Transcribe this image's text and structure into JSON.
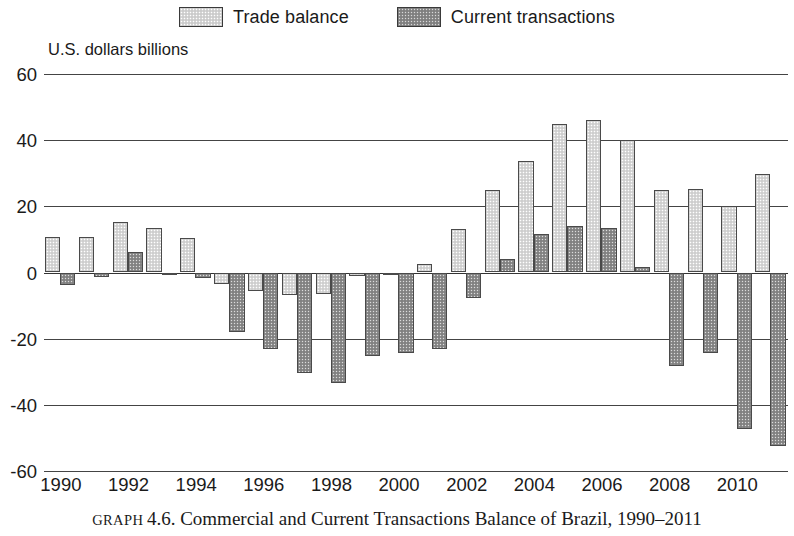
{
  "legend": {
    "items": [
      {
        "label": "Trade balance",
        "key": "trade",
        "swatch": "light-gray-dotted",
        "color": "#d9d9d9"
      },
      {
        "label": "Current transactions",
        "key": "current",
        "swatch": "dark-gray-dotted",
        "color": "#8c8c8c"
      }
    ]
  },
  "axis_title": "U.S. dollars billions",
  "caption": {
    "label": "GRAPH",
    "number": "4.6.",
    "text": "Commercial and Current Transactions Balance of Brazil, 1990–2011"
  },
  "chart_data": {
    "type": "bar",
    "title": "Commercial and Current Transactions Balance of Brazil, 1990–2011",
    "xlabel": "",
    "ylabel": "U.S. dollars billions",
    "ylim": [
      -60,
      60
    ],
    "ytick_labels": [
      "60",
      "40",
      "20",
      "0",
      "-20",
      "-40",
      "-60"
    ],
    "yticks": [
      60,
      40,
      20,
      0,
      -20,
      -40,
      -60
    ],
    "grid": true,
    "legend_position": "top-center",
    "categories": [
      1990,
      1991,
      1992,
      1993,
      1994,
      1995,
      1996,
      1997,
      1998,
      1999,
      2000,
      2001,
      2002,
      2003,
      2004,
      2005,
      2006,
      2007,
      2008,
      2009,
      2010,
      2011
    ],
    "xtick_labels": [
      "1990",
      "1992",
      "1994",
      "1996",
      "1998",
      "2000",
      "2002",
      "2004",
      "2006",
      "2008",
      "2010"
    ],
    "xticks": [
      1990,
      1992,
      1994,
      1996,
      1998,
      2000,
      2002,
      2004,
      2006,
      2008,
      2010
    ],
    "series": [
      {
        "name": "Trade balance",
        "color": "#d9d9d9",
        "values": [
          10.8,
          10.6,
          15.2,
          13.3,
          10.5,
          -3.5,
          -5.6,
          -6.8,
          -6.6,
          -1.2,
          -0.7,
          2.7,
          13.2,
          24.8,
          33.8,
          44.9,
          46.1,
          40.0,
          24.8,
          25.3,
          20.2,
          29.8
        ]
      },
      {
        "name": "Current transactions",
        "color": "#8c8c8c",
        "values": [
          -3.8,
          -1.4,
          6.1,
          -0.7,
          -1.8,
          -18.0,
          -23.2,
          -30.5,
          -33.4,
          -25.3,
          -24.2,
          -23.2,
          -7.6,
          4.2,
          11.7,
          14.0,
          13.6,
          1.6,
          -28.2,
          -24.3,
          -47.3,
          -52.5
        ]
      }
    ]
  }
}
